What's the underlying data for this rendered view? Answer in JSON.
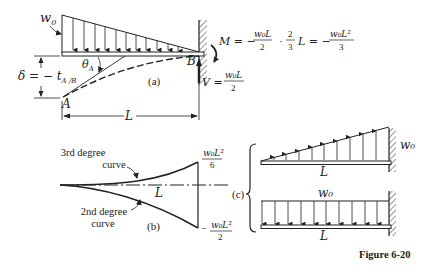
{
  "figure": {
    "caption": "Figure 6-20"
  },
  "part_a": {
    "label": "(a)",
    "load_label": "w",
    "load_sub": "0",
    "point_a": "A",
    "point_b": "B",
    "theta": "θ",
    "theta_sub": "A",
    "delta_eq": "δ = − t",
    "delta_sub": "A /B",
    "length": "L",
    "moment_lhs": "M = −",
    "moment_f1_num": "w₀L",
    "moment_f1_den": "2",
    "moment_dot": "·",
    "moment_f2_num": "2",
    "moment_f2_den": "3",
    "moment_mid": "L = −",
    "moment_f3_num": "w₀L²",
    "moment_f3_den": "3",
    "shear_lhs": "V =",
    "shear_num": "w₀L",
    "shear_den": "2"
  },
  "part_b": {
    "label": "(b)",
    "upper_curve_line1": "3rd degree",
    "upper_curve_line2": "curve",
    "lower_curve_line1": "2nd degree",
    "lower_curve_line2": "curve",
    "length": "L",
    "top_value_num": "w₀L²",
    "top_value_den": "6",
    "bottom_value_sign": "−",
    "bottom_value_num": "w₀L²",
    "bottom_value_den": "2"
  },
  "part_c": {
    "label": "(c)",
    "upper_beam_load": "w₀",
    "upper_beam_length": "L",
    "lower_beam_load": "w₀",
    "lower_beam_length": "L"
  }
}
